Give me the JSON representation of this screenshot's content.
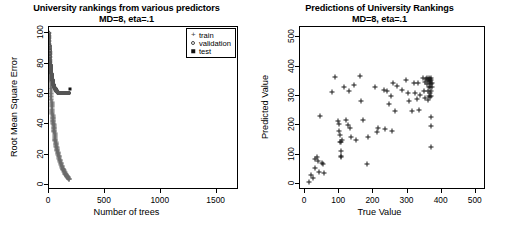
{
  "figure": {
    "width": 506,
    "height": 248,
    "background": "#ffffff",
    "panels": 2
  },
  "left_panel": {
    "title_main": "University rankings from various predictors",
    "title_sub": "MD=8, eta=.1",
    "xlabel": "Number of trees",
    "ylabel": "Root Mean Square Error",
    "xticks": [
      "0",
      "500",
      "1000",
      "1500"
    ],
    "yticks": [
      "0",
      "20",
      "40",
      "60",
      "80",
      "100"
    ],
    "legend": {
      "items": [
        {
          "key": "plus-marker",
          "label": "train"
        },
        {
          "key": "circle-marker",
          "label": "validation"
        },
        {
          "key": "square-marker",
          "label": "test"
        }
      ]
    }
  },
  "right_panel": {
    "title_main": "Predictions of University Rankings",
    "title_sub": "MD=8, eta=.1",
    "xlabel": "True Value",
    "ylabel": "Predicted Value",
    "xticks": [
      "0",
      "100",
      "200",
      "300",
      "400",
      "500"
    ],
    "yticks": [
      "0",
      "100",
      "200",
      "300",
      "400",
      "500"
    ]
  },
  "chart_data": [
    {
      "id": "rmse-vs-trees",
      "type": "line",
      "title": "University rankings from various predictors",
      "subtitle": "MD=8, eta=.1",
      "xlabel": "Number of trees",
      "ylabel": "Root Mean Square Error",
      "xlim": [
        0,
        1700
      ],
      "ylim": [
        -3,
        104
      ],
      "grid": false,
      "legend_position": "top-right",
      "series": [
        {
          "name": "train",
          "marker": "plus",
          "color": "#6b6b6b",
          "x": [
            1,
            3,
            5,
            8,
            11,
            14,
            17,
            20,
            23,
            26,
            29,
            32,
            35,
            38,
            41,
            44,
            47,
            50,
            54,
            58,
            63,
            68,
            74,
            80,
            87,
            95,
            104,
            113,
            122,
            132,
            142,
            152,
            162,
            172,
            180
          ],
          "y": [
            100,
            93,
            86,
            79,
            73,
            68,
            63,
            59,
            55,
            52,
            49,
            46,
            44,
            42,
            40,
            38,
            36,
            34,
            31,
            29,
            27,
            25,
            23,
            21,
            19,
            17,
            15,
            13,
            11,
            10,
            8,
            7,
            6,
            5,
            4
          ]
        },
        {
          "name": "validation",
          "marker": "circle",
          "color": "#555555",
          "x": [
            1,
            3,
            5,
            8,
            11,
            14,
            17,
            20,
            23,
            26,
            29,
            32,
            35,
            38,
            41,
            44,
            47,
            50,
            55,
            60,
            66,
            72,
            80,
            90,
            100,
            112,
            125,
            140,
            155,
            170,
            180
          ],
          "y": [
            100,
            95,
            90,
            86,
            82,
            79,
            77,
            75,
            73,
            72,
            70,
            69,
            68,
            67,
            66,
            65,
            65,
            64,
            63,
            63,
            62,
            62,
            61,
            61,
            61,
            61,
            61,
            61,
            61,
            61,
            61
          ]
        },
        {
          "name": "test",
          "marker": "square",
          "color": "#111111",
          "x": [
            185
          ],
          "y": [
            63
          ]
        }
      ]
    },
    {
      "id": "predicted-vs-true",
      "type": "scatter",
      "title": "Predictions of University Rankings",
      "subtitle": "MD=8, eta=.1",
      "xlabel": "True Value",
      "ylabel": "Predicted Value",
      "xlim": [
        -15,
        530
      ],
      "ylim": [
        -20,
        535
      ],
      "grid": false,
      "legend_position": "none",
      "points": [
        [
          12,
          8
        ],
        [
          18,
          30
        ],
        [
          22,
          22
        ],
        [
          28,
          55
        ],
        [
          30,
          85
        ],
        [
          35,
          92
        ],
        [
          38,
          78
        ],
        [
          42,
          40
        ],
        [
          48,
          72
        ],
        [
          52,
          68
        ],
        [
          55,
          38
        ],
        [
          45,
          232
        ],
        [
          80,
          313
        ],
        [
          88,
          365
        ],
        [
          95,
          215
        ],
        [
          100,
          205
        ],
        [
          100,
          180
        ],
        [
          102,
          168
        ],
        [
          103,
          145
        ],
        [
          104,
          143
        ],
        [
          104,
          112
        ],
        [
          105,
          95
        ],
        [
          106,
          92
        ],
        [
          108,
          150
        ],
        [
          115,
          330
        ],
        [
          120,
          218
        ],
        [
          125,
          200
        ],
        [
          128,
          318
        ],
        [
          132,
          190
        ],
        [
          135,
          160
        ],
        [
          142,
          338
        ],
        [
          150,
          150
        ],
        [
          160,
          368
        ],
        [
          165,
          282
        ],
        [
          170,
          220
        ],
        [
          180,
          70
        ],
        [
          185,
          160
        ],
        [
          205,
          330
        ],
        [
          210,
          178
        ],
        [
          215,
          192
        ],
        [
          230,
          322
        ],
        [
          235,
          188
        ],
        [
          240,
          318
        ],
        [
          245,
          272
        ],
        [
          252,
          300
        ],
        [
          255,
          182
        ],
        [
          258,
          345
        ],
        [
          262,
          250
        ],
        [
          270,
          335
        ],
        [
          285,
          320
        ],
        [
          295,
          355
        ],
        [
          300,
          310
        ],
        [
          305,
          282
        ],
        [
          312,
          248
        ],
        [
          318,
          345
        ],
        [
          322,
          310
        ],
        [
          328,
          290
        ],
        [
          332,
          345
        ],
        [
          335,
          252
        ],
        [
          338,
          302
        ],
        [
          345,
          362
        ],
        [
          348,
          318
        ],
        [
          350,
          348
        ],
        [
          352,
          292
        ],
        [
          355,
          358
        ],
        [
          356,
          340
        ],
        [
          358,
          360
        ],
        [
          360,
          355
        ],
        [
          360,
          318
        ],
        [
          360,
          288
        ],
        [
          362,
          352
        ],
        [
          362,
          332
        ],
        [
          363,
          300
        ],
        [
          364,
          362
        ],
        [
          365,
          358
        ],
        [
          365,
          345
        ],
        [
          366,
          330
        ],
        [
          366,
          310
        ],
        [
          367,
          352
        ],
        [
          367,
          298
        ],
        [
          368,
          362
        ],
        [
          368,
          340
        ],
        [
          369,
          318
        ],
        [
          370,
          355
        ],
        [
          370,
          300
        ],
        [
          371,
          345
        ],
        [
          372,
          332
        ],
        [
          368,
          230
        ],
        [
          369,
          198
        ],
        [
          370,
          125
        ]
      ]
    }
  ]
}
